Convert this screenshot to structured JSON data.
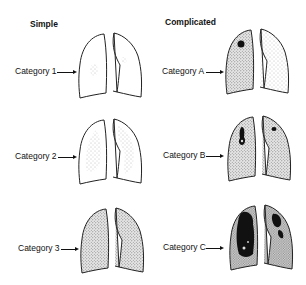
{
  "columns": [
    {
      "title": "Simple"
    },
    {
      "title": "Complicated"
    }
  ],
  "categories": {
    "simple": [
      {
        "label": "Category 1"
      },
      {
        "label": "Category 2"
      },
      {
        "label": "Category 3"
      }
    ],
    "complicated": [
      {
        "label": "Category A"
      },
      {
        "label": "Category B"
      },
      {
        "label": "Category C"
      }
    ]
  }
}
